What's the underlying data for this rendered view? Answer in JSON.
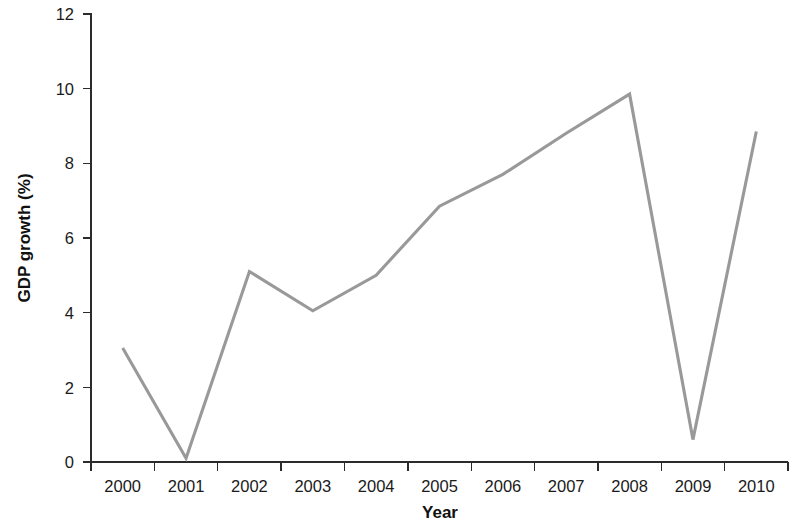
{
  "chart_data": {
    "type": "line",
    "title": "",
    "subtitle": "",
    "xlabel": "Year",
    "ylabel": "GDP growth (%)",
    "x": [
      2000,
      2001,
      2002,
      2003,
      2004,
      2005,
      2006,
      2007,
      2008,
      2009,
      2010
    ],
    "values": [
      3.05,
      0.1,
      5.1,
      4.05,
      5.0,
      6.85,
      7.7,
      8.8,
      9.85,
      0.6,
      8.85
    ],
    "series": [
      {
        "name": "GDP growth",
        "values": [
          3.05,
          0.1,
          5.1,
          4.05,
          5.0,
          6.85,
          7.7,
          8.8,
          9.85,
          0.6,
          8.85
        ]
      }
    ],
    "categories": [
      "2000",
      "2001",
      "2002",
      "2003",
      "2004",
      "2005",
      "2006",
      "2007",
      "2008",
      "2009",
      "2010"
    ],
    "xtick_labels": [
      "2000",
      "2001",
      "2002",
      "2003",
      "2004",
      "2005",
      "2006",
      "2007",
      "2008",
      "2009",
      "2010"
    ],
    "ytick_labels": [
      "0",
      "2",
      "4",
      "6",
      "8",
      "10",
      "12"
    ],
    "ytick_values": [
      0,
      2,
      4,
      6,
      8,
      10,
      12
    ],
    "ylim": [
      0,
      12
    ],
    "xlim": [
      2000,
      2010
    ],
    "grid": false,
    "legend": false,
    "legend_position": "none",
    "line_color": "#999999",
    "axis_color": "#2b2b2b",
    "background_color": "#ffffff",
    "annotations": []
  }
}
